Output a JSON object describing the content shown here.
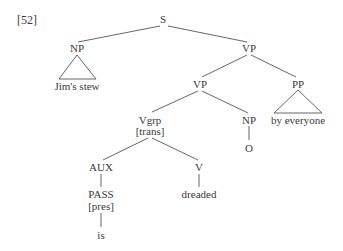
{
  "example_number": "[52]",
  "tree": {
    "S": "S",
    "subject_np": "NP",
    "subject_text": "Jim's stew",
    "vp_top": "VP",
    "vp_inner": "VP",
    "pp": "PP",
    "pp_text": "by everyone",
    "vgrp": "Vgrp",
    "vgrp_feature": "[trans]",
    "object_np": "NP",
    "object_text": "O",
    "aux": "AUX",
    "pass": "PASS",
    "pass_feature": "[pres]",
    "aux_word": "is",
    "v": "V",
    "verb_word": "dreaded"
  },
  "colors": {
    "line": "#555555",
    "text": "#3a3a3a"
  }
}
